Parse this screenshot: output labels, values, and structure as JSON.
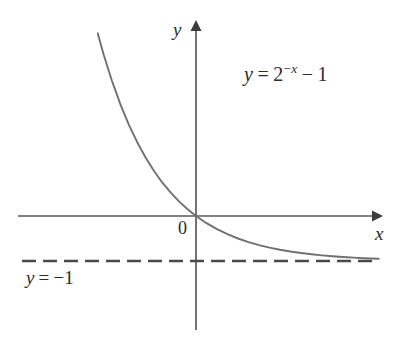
{
  "figure": {
    "background_color": "#ffffff"
  },
  "labels": {
    "y_axis": "y",
    "x_axis": "x",
    "origin": "0",
    "equation": {
      "lhs": "y",
      "equals": "=",
      "base": "2",
      "exponent_sign": "−",
      "exponent_var": "x",
      "minus": "−",
      "constant": "1",
      "full_text": "y = 2−x − 1"
    },
    "asymptote": {
      "lhs": "y",
      "equals": "=",
      "value": "−1",
      "full_text": "y = −1"
    }
  },
  "colors": {
    "curve": "#707070",
    "axis": "#5a5a5a",
    "asymptote": "#4a4a4a",
    "text": "#2b2b2b",
    "background": "#ffffff"
  },
  "chart_data": {
    "type": "line",
    "title": "",
    "xlabel": "x",
    "ylabel": "y",
    "grid": false,
    "legend": "none",
    "xlim": [
      -2.34,
      4.35
    ],
    "ylim": [
      -1.25,
      4.3
    ],
    "annotations": [
      {
        "name": "equation",
        "text": "y = 2^{-x} - 1",
        "x": 1.2,
        "y": 3.5
      },
      {
        "name": "asymptote-label",
        "text": "y = -1",
        "x": -3.6,
        "y": -1.35
      },
      {
        "name": "origin",
        "text": "0",
        "x": -0.28,
        "y": -0.24
      }
    ],
    "asymptotes": [
      {
        "type": "horizontal",
        "value": -1,
        "style": "dashed",
        "label": "y = -1"
      }
    ],
    "series": [
      {
        "name": "y = 2^{-x} - 1",
        "style": "solid",
        "color": "#707070",
        "x": [
          -2.34,
          -2.2,
          -2.0,
          -1.8,
          -1.6,
          -1.4,
          -1.2,
          -1.0,
          -0.8,
          -0.6,
          -0.4,
          -0.2,
          0.0,
          0.25,
          0.5,
          0.75,
          1.0,
          1.25,
          1.5,
          1.75,
          2.0,
          2.25,
          2.5,
          2.75,
          3.0,
          3.25,
          3.5,
          3.75,
          4.0,
          4.35
        ],
        "y": [
          4.06,
          3.59,
          3.0,
          2.48,
          2.03,
          1.64,
          1.3,
          1.0,
          0.74,
          0.52,
          0.32,
          0.15,
          0.0,
          -0.159,
          -0.293,
          -0.405,
          -0.5,
          -0.579,
          -0.646,
          -0.703,
          -0.75,
          -0.79,
          -0.823,
          -0.851,
          -0.875,
          -0.895,
          -0.912,
          -0.926,
          -0.938,
          -0.951
        ]
      }
    ]
  },
  "geometry": {
    "origin_px": {
      "x": 196,
      "y": 216
    },
    "x_unit_px": 42,
    "y_unit_px": 45,
    "x_axis": {
      "x_start": 18,
      "x_end": 380,
      "y": 216,
      "arrow": "right"
    },
    "y_axis": {
      "x": 196,
      "y_start": 22,
      "y_end": 330,
      "arrow": "up"
    },
    "asymptote_line": {
      "x_start": 22,
      "x_end": 376,
      "y": 261,
      "dash": "14 7"
    }
  }
}
